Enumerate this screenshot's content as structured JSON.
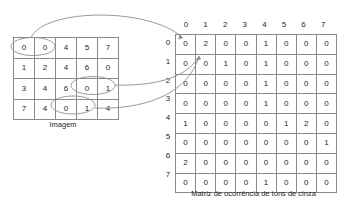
{
  "figure": {
    "image_matrix": {
      "caption": "Imagem",
      "rows": [
        [
          0,
          0,
          4,
          5,
          7
        ],
        [
          1,
          2,
          4,
          6,
          0
        ],
        [
          3,
          4,
          6,
          0,
          1
        ],
        [
          7,
          4,
          0,
          1,
          4
        ]
      ]
    },
    "glcm_matrix": {
      "caption": "Matriz de ocorrência de tons de cinza",
      "col_headers": [
        "0",
        "1",
        "2",
        "3",
        "4",
        "5",
        "6",
        "7"
      ],
      "row_headers": [
        "0",
        "1",
        "2",
        "3",
        "4",
        "5",
        "6",
        "7"
      ],
      "rows": [
        [
          0,
          2,
          0,
          0,
          1,
          0,
          0,
          0
        ],
        [
          0,
          0,
          1,
          0,
          1,
          0,
          0,
          0
        ],
        [
          0,
          0,
          0,
          0,
          1,
          0,
          0,
          0
        ],
        [
          0,
          0,
          0,
          0,
          1,
          0,
          0,
          0
        ],
        [
          1,
          0,
          0,
          0,
          0,
          1,
          2,
          0
        ],
        [
          0,
          0,
          0,
          0,
          0,
          0,
          0,
          1
        ],
        [
          2,
          0,
          0,
          0,
          0,
          0,
          0,
          0
        ],
        [
          0,
          0,
          0,
          0,
          1,
          0,
          0,
          0
        ]
      ]
    },
    "annotations": {
      "highlight_ellipses": [
        {
          "name": "pair-0-0-row0",
          "pair": "0,0"
        },
        {
          "name": "pair-0-1-row2",
          "pair": "0,1"
        },
        {
          "name": "pair-0-1-row3",
          "pair": "0,1"
        }
      ],
      "arrows": [
        {
          "name": "arrow-to-cell-0-0",
          "from": "pair-0-0-row0",
          "to_cell": "0,0"
        },
        {
          "name": "arrow-to-cell-0-1-a",
          "from": "pair-0-1-row2",
          "to_cell": "0,1"
        },
        {
          "name": "arrow-to-cell-0-1-b",
          "from": "pair-0-1-row3",
          "to_cell": "0,1"
        }
      ]
    },
    "colors": {
      "grid_line": "#8a8a8a",
      "annotation": "#8f8f8f",
      "text": "#262626",
      "background": "#ffffff"
    }
  }
}
